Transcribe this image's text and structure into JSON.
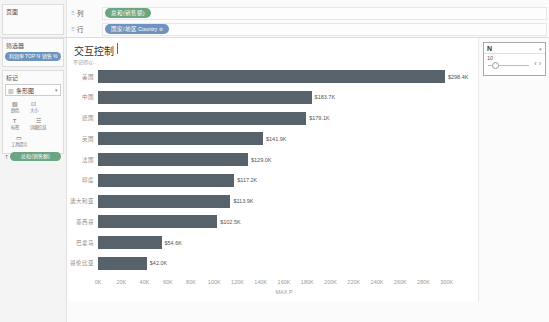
{
  "pages": {
    "label": "页面"
  },
  "filters": {
    "label": "筛选器",
    "pill": "利润率 TOP N 销售 %"
  },
  "marks": {
    "label": "标记",
    "mark_type": "条形图",
    "buttons": [
      {
        "label": "颜色"
      },
      {
        "label": "大小"
      },
      {
        "label": "标签"
      },
      {
        "label": "详细信息"
      },
      {
        "label": "工具提示"
      }
    ],
    "pill": "总和(销售额)"
  },
  "shelves": {
    "columns_label": "列",
    "rows_label": "行",
    "columns_pill": "总和(销售额)",
    "rows_pill": "国家/地区 Country"
  },
  "sheet": {
    "title": "交互控制",
    "subtitle": "不记得以.."
  },
  "parameter": {
    "title": "N",
    "value": "10"
  },
  "icons": {
    "shelf_grid": "⠿",
    "mark_type": "▥",
    "caret_down": "▾",
    "color": "▧",
    "size": "⊡",
    "label": "T",
    "detail": "☰",
    "tooltip": "▭",
    "pill_label": "T",
    "rows_pill_badge": "⊘",
    "stepper_left": "‹",
    "stepper_right": "›"
  },
  "colors": {
    "bar": "#58626a",
    "pill_blue": "#6e94bd",
    "pill_green": "#6ba583"
  },
  "chart_data": {
    "type": "bar",
    "orientation": "horizontal",
    "title": "交互控制",
    "categories": [
      "美国",
      "中国",
      "德国",
      "英国",
      "法国",
      "印度",
      "澳大利亚",
      "墨西哥",
      "巴拿马",
      "哥伦比亚"
    ],
    "values": [
      298.4,
      183.7,
      179.1,
      141.9,
      129.0,
      117.2,
      113.9,
      102.5,
      54.6,
      42.0
    ],
    "value_labels": [
      "$298.4K",
      "$183.7K",
      "$179.1K",
      "$141.9K",
      "$129.0K",
      "$117.2K",
      "$113.9K",
      "$102.5K",
      "$54.6K",
      "$42.0K"
    ],
    "x_ticks": [
      "0K",
      "20K",
      "40K",
      "60K",
      "80K",
      "100K",
      "120K",
      "140K",
      "160K",
      "180K",
      "200K",
      "220K",
      "240K",
      "260K",
      "280K",
      "300K"
    ],
    "xlim": [
      0,
      320
    ],
    "xlabel": "MAX P",
    "ylabel": "",
    "grid": false,
    "legend": false
  }
}
